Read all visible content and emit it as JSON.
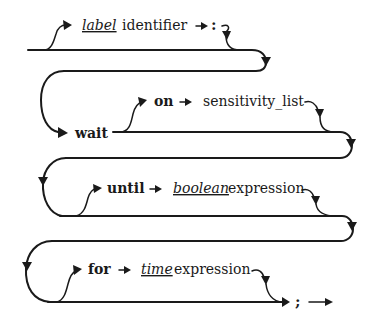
{
  "diagram": {
    "type": "railroad-syntax-diagram",
    "rows": [
      {
        "id": "label",
        "optional": true,
        "items": [
          {
            "kind": "italic-underlined",
            "text": "label"
          },
          {
            "kind": "plain",
            "text": "identifier"
          },
          {
            "kind": "arrow",
            "text": "→"
          },
          {
            "kind": "punctuation",
            "text": ":"
          }
        ]
      },
      {
        "id": "wait",
        "optional": false,
        "items": [
          {
            "kind": "keyword",
            "text": "wait"
          }
        ]
      },
      {
        "id": "sensitivity",
        "optional": true,
        "items": [
          {
            "kind": "keyword",
            "text": "on"
          },
          {
            "kind": "arrow",
            "text": "→"
          },
          {
            "kind": "plain",
            "text": "sensitivity_list"
          }
        ]
      },
      {
        "id": "condition",
        "optional": true,
        "items": [
          {
            "kind": "keyword",
            "text": "until"
          },
          {
            "kind": "arrow",
            "text": "→"
          },
          {
            "kind": "italic-underlined",
            "text": "boolean"
          },
          {
            "kind": "plain",
            "text": "expression"
          }
        ]
      },
      {
        "id": "timeout",
        "optional": true,
        "items": [
          {
            "kind": "keyword",
            "text": "for"
          },
          {
            "kind": "arrow",
            "text": "→"
          },
          {
            "kind": "italic-underlined",
            "text": "time"
          },
          {
            "kind": "plain",
            "text": "expression"
          }
        ]
      },
      {
        "id": "terminator",
        "optional": false,
        "items": [
          {
            "kind": "punctuation",
            "text": ";"
          },
          {
            "kind": "arrow",
            "text": "→"
          }
        ]
      }
    ],
    "colors": {
      "line": "#1a1a1a",
      "background": "#ffffff"
    }
  }
}
